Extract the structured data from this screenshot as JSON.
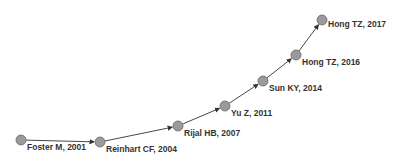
{
  "diagram": {
    "type": "citation-path",
    "node_color": "#9a9a9a",
    "edge_color": "#333333",
    "nodes": [
      {
        "label": "Foster M, 2001",
        "x": 21,
        "y": 140,
        "lx": 27,
        "ly": 146
      },
      {
        "label": "Reinhart CF, 2004",
        "x": 100,
        "y": 142,
        "lx": 106,
        "ly": 148
      },
      {
        "label": "Rijal HB, 2007",
        "x": 178,
        "y": 126,
        "lx": 184,
        "ly": 132
      },
      {
        "label": "Yu Z, 2011",
        "x": 225,
        "y": 106,
        "lx": 231,
        "ly": 112
      },
      {
        "label": "Sun KY, 2014",
        "x": 263,
        "y": 81,
        "lx": 269,
        "ly": 87
      },
      {
        "label": "Hong TZ, 2016",
        "x": 296,
        "y": 55,
        "lx": 302,
        "ly": 61
      },
      {
        "label": "Hong TZ, 2017",
        "x": 322,
        "y": 20,
        "lx": 328,
        "ly": 23
      }
    ]
  }
}
